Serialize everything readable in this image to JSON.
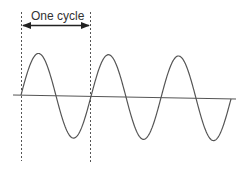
{
  "diagram": {
    "title": "One cycle",
    "cycles_shown": 3,
    "colors": {
      "wave": "#555555",
      "axis": "#555555",
      "guides": "#555555",
      "arrow": "#222222",
      "text": "#333333"
    }
  }
}
